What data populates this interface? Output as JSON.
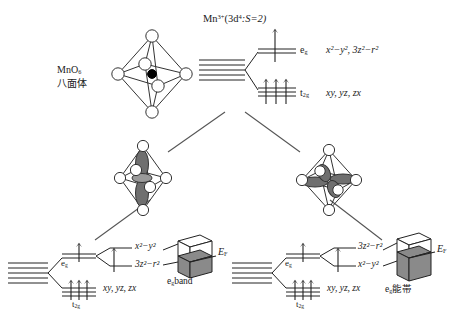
{
  "figure": {
    "ion_label_main": "Mn",
    "ion_label_charge": "3+",
    "ion_label_config": "(3d",
    "ion_label_config_sup": "4",
    "ion_label_spin": ":S=2)"
  },
  "top": {
    "octahedron_label_line1": "MnO",
    "octahedron_label_line1_sub": "6",
    "octahedron_label_line2": "八面体",
    "eg_symbol": "e",
    "eg_sub": "g",
    "eg_orbitals": "x²−y², 3z²−r²",
    "t2g_symbol": "t",
    "t2g_sub": "2g",
    "t2g_orbitals": "xy, yz, zx",
    "eg_electrons": 1,
    "t2g_electrons": 3,
    "free_ion_levels": 5
  },
  "left": {
    "eg_symbol": "e",
    "eg_sub": "g",
    "upper_orbital": "x²−y²",
    "lower_orbital": "3z²−r²",
    "t2g_symbol": "t",
    "t2g_sub": "2g",
    "t2g_orbitals": "xy, yz, zx",
    "eg_electrons": 1,
    "t2g_electrons": 3,
    "band_label": "e",
    "band_label_sub": "g",
    "band_label_rest": "band",
    "fermi_label": "E",
    "fermi_sub": "F",
    "distortion": "elongated octahedron, 3z²−r² orbital"
  },
  "right": {
    "eg_symbol": "e",
    "eg_sub": "g",
    "upper_orbital": "3z²−r²",
    "lower_orbital": "x²−y²",
    "t2g_symbol": "t",
    "t2g_sub": "2g",
    "t2g_orbitals": "xy, yz, zx",
    "eg_electrons": 1,
    "t2g_electrons": 3,
    "band_label": "e",
    "band_label_sub": "g",
    "band_label_rest": "能帯",
    "fermi_label": "E",
    "fermi_sub": "F",
    "distortion": "compressed octahedron, x²−y² orbital"
  },
  "colors": {
    "ink": "#222222",
    "band_filled": "#8a8a8a",
    "band_empty": "#ffffff",
    "orbital_lobe": "#6f6f6f",
    "atom_center": "#000000",
    "atom_ligand": "#ffffff"
  }
}
